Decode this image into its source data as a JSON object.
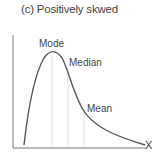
{
  "title": "(c) Positively skwed",
  "labels": {
    "mode": "Mode",
    "median": "Median",
    "mean": "Mean",
    "x_axis": "X"
  },
  "colors": {
    "curve": "#555555",
    "axis": "#777777",
    "guide": "#e6e6e6"
  }
}
